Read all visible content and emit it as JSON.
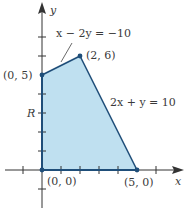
{
  "diagram": {
    "type": "feasible-region",
    "colors": {
      "region_fill": "#bfe0f0",
      "boundary": "#1f4e79",
      "axis": "#333333",
      "text": "#3a3a3a"
    },
    "axes": {
      "x_label": "x",
      "y_label": "y",
      "x_ticks": [
        -1,
        1,
        2,
        3,
        4,
        5,
        6
      ],
      "y_ticks": [
        -1,
        1,
        2,
        3,
        4,
        5,
        6,
        7
      ]
    },
    "region_label": "R",
    "vertices": [
      {
        "label": "(0, 0)",
        "x": 0,
        "y": 0
      },
      {
        "label": "(5, 0)",
        "x": 5,
        "y": 0
      },
      {
        "label": "(2, 6)",
        "x": 2,
        "y": 6
      },
      {
        "label": "(0, 5)",
        "x": 0,
        "y": 5
      }
    ],
    "constraints": [
      {
        "equation": "x − 2y = −10"
      },
      {
        "equation": "2x + y = 10"
      }
    ]
  }
}
